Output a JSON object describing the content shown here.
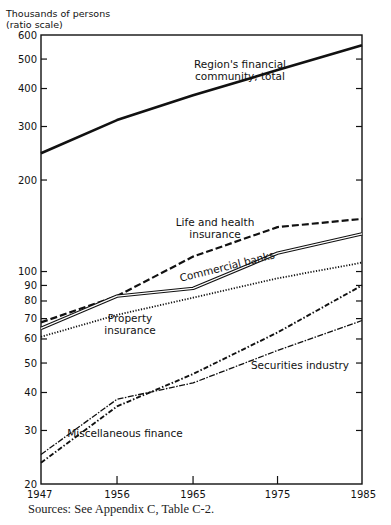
{
  "chart_data": {
    "type": "line",
    "title": "",
    "ylabel": "Thousands of persons",
    "ylabel_note": "(ratio scale)",
    "xlabel": "",
    "yscale": "log",
    "ylim": [
      20,
      600
    ],
    "xlim": [
      1947,
      1985
    ],
    "grid": false,
    "legend": "inline labels",
    "y_ticks": [
      20,
      30,
      40,
      50,
      60,
      70,
      80,
      90,
      100,
      200,
      300,
      400,
      500,
      600
    ],
    "x_ticks": [
      1947,
      1956,
      1965,
      1975,
      1985
    ],
    "x": [
      1947,
      1956,
      1965,
      1975,
      1985
    ],
    "series": [
      {
        "name": "Region's financial community, total",
        "label_lines": [
          "Region's financial",
          "community, total"
        ],
        "style": "solid-thick",
        "values": [
          245,
          315,
          380,
          460,
          555
        ]
      },
      {
        "name": "Life and health insurance",
        "label_lines": [
          "Life and health",
          "insurance"
        ],
        "style": "dashed",
        "values": [
          68,
          83,
          112,
          140,
          149
        ]
      },
      {
        "name": "Commercial banks",
        "label_lines": [
          "Commercial banks"
        ],
        "style": "double",
        "values": [
          65,
          83,
          88,
          115,
          133
        ]
      },
      {
        "name": "Property insurance",
        "label_lines": [
          "Property",
          "insurance"
        ],
        "style": "dotted",
        "values": [
          61,
          72,
          82,
          95,
          107
        ]
      },
      {
        "name": "Securities industry",
        "label_lines": [
          "Securities industry"
        ],
        "style": "dash-dot-thin",
        "values": [
          25,
          38,
          43,
          55,
          69
        ]
      },
      {
        "name": "Miscellaneous finance",
        "label_lines": [
          "Miscellaneous finance"
        ],
        "style": "dash-dot",
        "values": [
          23.5,
          36,
          46,
          63,
          90
        ]
      }
    ]
  },
  "source_note": "Sources: See Appendix C, Table C-2."
}
